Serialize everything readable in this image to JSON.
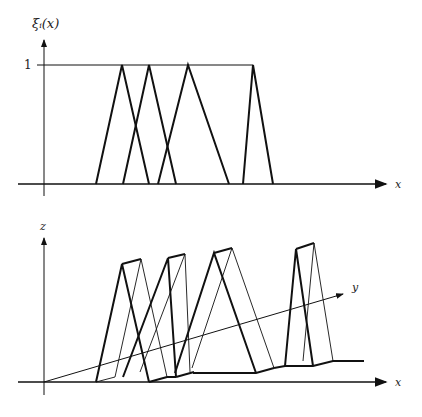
{
  "top_plot": {
    "y_label": "ξᵢ(x)",
    "x_label": "x",
    "tick_label": "1",
    "triangles": [
      {
        "left": 96,
        "peak": 122,
        "right": 149
      },
      {
        "left": 123,
        "peak": 149,
        "right": 176
      },
      {
        "left": 158,
        "peak": 188,
        "right": 229
      },
      {
        "left": 243,
        "peak": 253,
        "right": 273
      }
    ]
  },
  "bottom_plot": {
    "z_label": "z",
    "y_label": "y",
    "x_label": "x"
  },
  "colors": {
    "stroke": "#111111",
    "background": "#ffffff"
  }
}
